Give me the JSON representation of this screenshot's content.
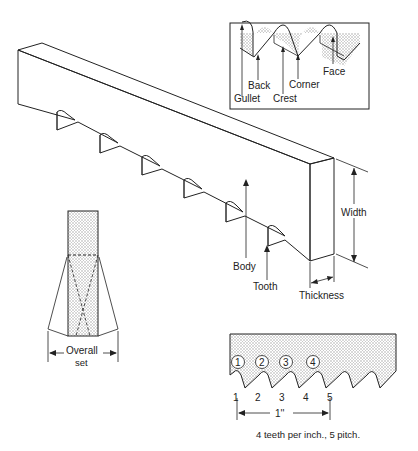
{
  "diagram": {
    "inset_labels": {
      "gullet": "Gullet",
      "back": "Back",
      "crest": "Crest",
      "corner": "Corner",
      "face": "Face"
    },
    "blade_labels": {
      "body": "Body",
      "tooth": "Tooth",
      "width": "Width",
      "thickness": "Thickness"
    },
    "set_labels": {
      "line1": "Overall",
      "line2": "set"
    },
    "pitch": {
      "circled_teeth": [
        "1",
        "2",
        "3",
        "4"
      ],
      "points": [
        "1",
        "2",
        "3",
        "4",
        "5"
      ],
      "span_label": "1''",
      "caption": "4 teeth per inch., 5 pitch."
    },
    "colors": {
      "line": "#222222",
      "stipple": "#b8b8b8"
    }
  }
}
